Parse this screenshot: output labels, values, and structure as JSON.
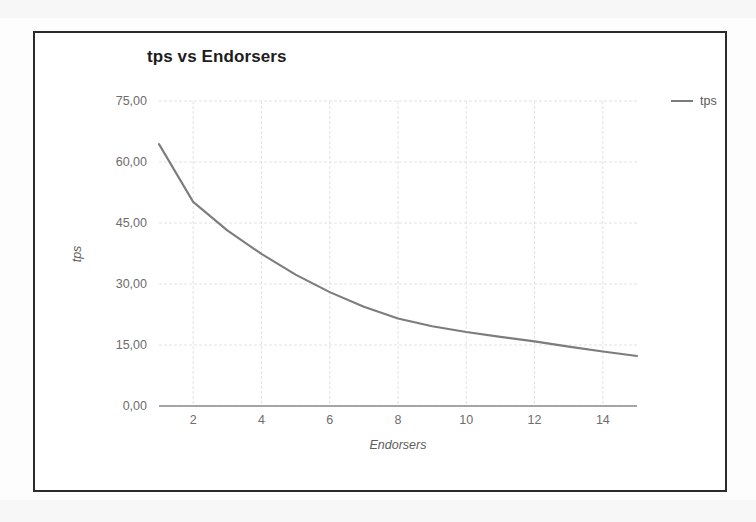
{
  "chart_data": {
    "type": "line",
    "title": "tps vs Endorsers",
    "xlabel": "Endorsers",
    "ylabel": "tps",
    "grid": true,
    "legend_position": "right",
    "xlim": [
      1,
      15
    ],
    "ylim": [
      0,
      75
    ],
    "x_tick_labels": [
      "2",
      "4",
      "6",
      "8",
      "10",
      "12",
      "14"
    ],
    "x_ticks": [
      2,
      4,
      6,
      8,
      10,
      12,
      14
    ],
    "y_tick_labels": [
      "0,00",
      "15,00",
      "30,00",
      "45,00",
      "60,00",
      "75,00"
    ],
    "y_ticks": [
      0,
      15,
      30,
      45,
      60,
      75
    ],
    "series": [
      {
        "name": "tps",
        "color": "#7c7c7c",
        "x": [
          1,
          2,
          3,
          4,
          5,
          6,
          7,
          8,
          9,
          10,
          11,
          12,
          13,
          14,
          15
        ],
        "values": [
          64.4,
          50.2,
          43.2,
          37.4,
          32.3,
          28.0,
          24.4,
          21.5,
          19.6,
          18.2,
          17.0,
          15.9,
          14.6,
          13.4,
          12.3
        ]
      }
    ]
  },
  "legend": {
    "entries": [
      {
        "label": "tps",
        "color": "#7c7c7c"
      }
    ]
  },
  "colors": {
    "series_line": "#7c7c7c",
    "frame": "#2b2b2b",
    "gridline": "#e2e2e8",
    "axis": "#8a8a8a",
    "tick_text": "#6d6d6d",
    "title_text": "#1d1d1d"
  }
}
